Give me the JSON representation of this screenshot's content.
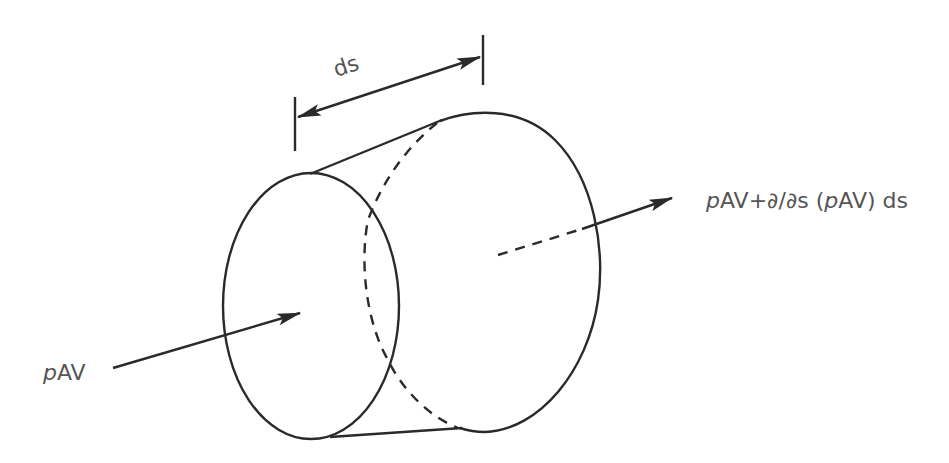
{
  "diagram": {
    "labels": {
      "length": "ds",
      "inflow_italic": "p",
      "inflow_rest": "AV",
      "outflow_p1": "p",
      "outflow_mid": "AV+∂/∂s (",
      "outflow_p2": "p",
      "outflow_end": "AV) ds"
    },
    "elements": [
      {
        "id": "inlet-face",
        "shape": "ellipse",
        "style": "solid"
      },
      {
        "id": "outlet-face",
        "shape": "ellipse",
        "style": "solid+hidden-dashed"
      },
      {
        "id": "inflow-arrow",
        "direction": "into inlet face"
      },
      {
        "id": "outflow-arrow",
        "direction": "out of outlet face"
      },
      {
        "id": "length-dimension",
        "label": "ds"
      }
    ],
    "colors": {
      "line": "#2a2a2a",
      "text": "#555555",
      "background": "#ffffff"
    }
  }
}
